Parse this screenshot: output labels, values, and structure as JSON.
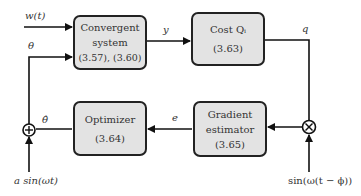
{
  "blocks": {
    "convergent": {
      "line1": "Convergent",
      "line2": "system",
      "line3": "(3.57), (3.60)"
    },
    "cost": {
      "line1": "Cost Qᵢ",
      "line2": "(3.63)"
    },
    "optimizer": {
      "line1": "Optimizer",
      "line2": "(3.64)"
    },
    "gradient": {
      "line1": "Gradient",
      "line2": "estimator",
      "line3": "(3.65)"
    }
  },
  "signals": {
    "w": "w(t)",
    "theta": "θ",
    "y": "y",
    "q": "q",
    "e": "e",
    "theta_hat": "θ̂",
    "dither": "a sin(ωt)",
    "demod": "sin(ω(t − ϕ))"
  },
  "junctions": {
    "sum": "+",
    "multiply": "×"
  },
  "colors": {
    "block_fill": "#e3e3e3",
    "stroke": "#222222"
  }
}
